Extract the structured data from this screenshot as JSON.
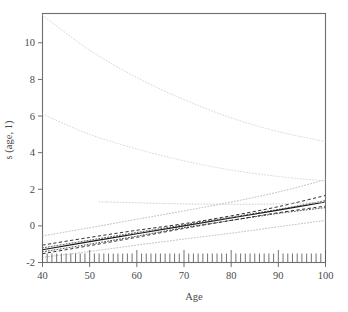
{
  "chart_data": {
    "type": "line",
    "title": "",
    "xlabel": "Age",
    "ylabel": "s (age, 1)",
    "xlim": [
      40,
      100
    ],
    "ylim": [
      -2,
      11.6
    ],
    "grid": false,
    "legend": null,
    "xticks": [
      40,
      50,
      60,
      70,
      80,
      90,
      100
    ],
    "yticks": [
      -2,
      0,
      2,
      4,
      6,
      8,
      10
    ],
    "xtick_labels": [
      "40",
      "50",
      "60",
      "70",
      "80",
      "90",
      "100"
    ],
    "ytick_labels": [
      "-2",
      "0",
      "2",
      "4",
      "6",
      "8",
      "10"
    ],
    "rug": {
      "present": true,
      "axis": "x",
      "count": 61,
      "x_start": 40,
      "x_end": 100,
      "description": "rug of observed age values along bottom axis"
    },
    "series": [
      {
        "name": "smooth-estimate",
        "style": "solid",
        "color": "#1a1a1a",
        "width": 1.1,
        "x": [
          40,
          50,
          60,
          70,
          80,
          90,
          100
        ],
        "y": [
          -1.3,
          -0.86,
          -0.43,
          0.0,
          0.43,
          0.86,
          1.3
        ]
      },
      {
        "name": "upper-confidence-band",
        "style": "dashed",
        "color": "#1a1a1a",
        "width": 0.9,
        "x": [
          40,
          50,
          60,
          70,
          80,
          90,
          100
        ],
        "y": [
          -1.05,
          -0.63,
          -0.24,
          0.12,
          0.55,
          1.05,
          1.66
        ]
      },
      {
        "name": "lower-confidence-band",
        "style": "dashed",
        "color": "#1a1a1a",
        "width": 0.9,
        "x": [
          40,
          50,
          60,
          70,
          80,
          90,
          100
        ],
        "y": [
          -1.52,
          -1.08,
          -0.62,
          -0.14,
          0.3,
          0.72,
          1.08
        ]
      },
      {
        "name": "alt-fit-dotted-upper",
        "style": "dotted",
        "color": "#2a2a2a",
        "width": 0.9,
        "x": [
          40,
          50,
          60,
          70,
          80,
          90,
          100
        ],
        "y": [
          -1.2,
          -0.78,
          -0.36,
          0.06,
          0.48,
          0.9,
          1.38
        ]
      },
      {
        "name": "alt-fit-dotted-lower",
        "style": "dotted",
        "color": "#2a2a2a",
        "width": 0.9,
        "x": [
          40,
          50,
          60,
          70,
          80,
          90,
          100
        ],
        "y": [
          -1.42,
          -1.0,
          -0.56,
          -0.1,
          0.3,
          0.68,
          1.0
        ]
      },
      {
        "name": "outer-band-upper",
        "style": "dotted",
        "color": "#b8b8b8",
        "width": 1.0,
        "x": [
          40,
          50,
          60,
          70,
          80,
          90,
          100
        ],
        "y": [
          -0.55,
          -0.1,
          0.36,
          0.82,
          1.3,
          1.85,
          2.52
        ]
      },
      {
        "name": "outer-band-lower",
        "style": "dotted",
        "color": "#b8b8b8",
        "width": 1.0,
        "x": [
          40,
          50,
          60,
          70,
          80,
          90,
          100
        ],
        "y": [
          -1.72,
          -1.4,
          -1.05,
          -0.72,
          -0.4,
          -0.05,
          0.3
        ]
      },
      {
        "name": "flat-dotted-segment",
        "style": "dotted",
        "color": "#c9c9c9",
        "width": 1.0,
        "x": [
          52,
          60,
          70,
          80,
          90,
          100
        ],
        "y": [
          1.32,
          1.26,
          1.2,
          1.18,
          1.2,
          1.3
        ]
      },
      {
        "name": "upper-decaying-curve-top",
        "style": "dotted",
        "color": "#d6d6d6",
        "width": 1.0,
        "x": [
          40,
          50,
          60,
          70,
          80,
          90,
          100
        ],
        "y": [
          11.5,
          9.6,
          8.1,
          6.9,
          5.9,
          5.15,
          4.6
        ]
      },
      {
        "name": "upper-decaying-curve-bottom",
        "style": "dotted",
        "color": "#d6d6d6",
        "width": 1.0,
        "x": [
          40,
          50,
          60,
          70,
          80,
          90,
          100
        ],
        "y": [
          6.1,
          5.0,
          4.2,
          3.55,
          3.05,
          2.7,
          2.45
        ]
      }
    ]
  },
  "axes": {
    "x_axis_label": "Age",
    "y_axis_label": "s (age, 1)"
  },
  "figure": {
    "background_color": "#ffffff",
    "frame_color": "#6e6e6e",
    "text_color": "#4a4a4a"
  }
}
